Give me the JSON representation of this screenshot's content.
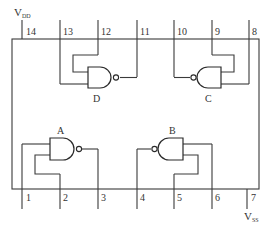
{
  "diagram": {
    "type": "quad NAND gate IC pinout (14-pin)",
    "power": {
      "vdd": {
        "main": "V",
        "sub": "DD",
        "pin": "14"
      },
      "vss": {
        "main": "V",
        "sub": "SS",
        "pin": "7"
      }
    },
    "top_pins": [
      {
        "num": "14"
      },
      {
        "num": "13"
      },
      {
        "num": "12"
      },
      {
        "num": "11"
      },
      {
        "num": "10"
      },
      {
        "num": "9"
      },
      {
        "num": "8"
      }
    ],
    "bottom_pins": [
      {
        "num": "1"
      },
      {
        "num": "2"
      },
      {
        "num": "3"
      },
      {
        "num": "4"
      },
      {
        "num": "5"
      },
      {
        "num": "6"
      },
      {
        "num": "7"
      }
    ],
    "gates": [
      {
        "label": "A",
        "inputs": [
          "1",
          "2"
        ],
        "output": "3"
      },
      {
        "label": "B",
        "inputs": [
          "5",
          "6"
        ],
        "output": "4"
      },
      {
        "label": "C",
        "inputs": [
          "8",
          "9"
        ],
        "output": "10"
      },
      {
        "label": "D",
        "inputs": [
          "12",
          "13"
        ],
        "output": "11"
      }
    ]
  }
}
